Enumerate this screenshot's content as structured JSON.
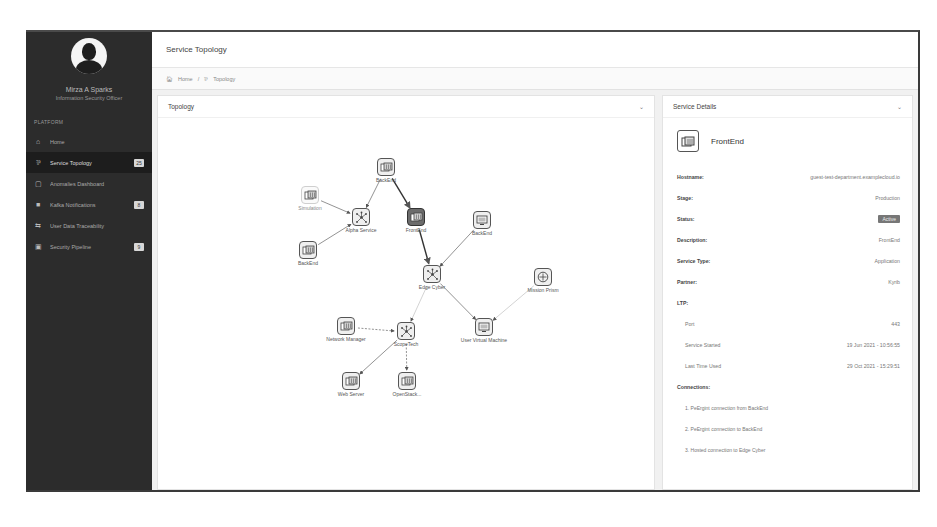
{
  "sidebar": {
    "user_name": "Mirza A Sparks",
    "user_role": "Information Security Officer",
    "section_label": "PLATFORM",
    "items": [
      {
        "label": "Home",
        "icon": "home-icon",
        "badge": null,
        "active": false
      },
      {
        "label": "Service Topology",
        "icon": "topology-icon",
        "badge": "25",
        "active": true
      },
      {
        "label": "Anomalies Dashboard",
        "icon": "dashboard-icon",
        "badge": null,
        "active": false
      },
      {
        "label": "Kafka Notifications",
        "icon": "bell-icon",
        "badge": "8",
        "active": false
      },
      {
        "label": "User Data Traceability",
        "icon": "trace-icon",
        "badge": null,
        "active": false
      },
      {
        "label": "Security Pipeline",
        "icon": "pipeline-icon",
        "badge": "9",
        "active": false
      }
    ]
  },
  "header": {
    "title": "Service Topology"
  },
  "breadcrumb": {
    "home": "Home",
    "separator": "/",
    "current": "Topology"
  },
  "topology_panel": {
    "title": "Topology",
    "nodes": [
      {
        "id": "backend_top",
        "label": "BackEnd",
        "type": "server",
        "x": 228,
        "y": 50,
        "style": "normal"
      },
      {
        "id": "simulation",
        "label": "Simulation",
        "type": "server",
        "x": 152,
        "y": 78,
        "style": "faded"
      },
      {
        "id": "alpha",
        "label": "Alpha Service",
        "type": "hub",
        "x": 203,
        "y": 100,
        "style": "normal"
      },
      {
        "id": "frontend",
        "label": "FrontEnd",
        "type": "server",
        "x": 258,
        "y": 100,
        "style": "dark"
      },
      {
        "id": "backend_left",
        "label": "BackEnd",
        "type": "server",
        "x": 150,
        "y": 133,
        "style": "normal"
      },
      {
        "id": "backend_right",
        "label": "BackEnd",
        "type": "monitor",
        "x": 324,
        "y": 103,
        "style": "normal"
      },
      {
        "id": "edge_cyber",
        "label": "Edge Cyber",
        "type": "hub",
        "x": 274,
        "y": 157,
        "style": "normal"
      },
      {
        "id": "mission_prism",
        "label": "Mission Prism",
        "type": "target",
        "x": 385,
        "y": 160,
        "style": "normal"
      },
      {
        "id": "user_vm",
        "label": "User Virtual Machine",
        "type": "monitor",
        "x": 326,
        "y": 210,
        "style": "normal"
      },
      {
        "id": "network_manager",
        "label": "Network Manager",
        "type": "server",
        "x": 188,
        "y": 209,
        "style": "normal"
      },
      {
        "id": "scope_tech",
        "label": "ScopeTech",
        "type": "hub",
        "x": 248,
        "y": 214,
        "style": "normal"
      },
      {
        "id": "web_server",
        "label": "Web Server",
        "type": "server",
        "x": 193,
        "y": 264,
        "style": "normal"
      },
      {
        "id": "openstack",
        "label": "OpenStack...",
        "type": "server",
        "x": 249,
        "y": 264,
        "style": "normal"
      }
    ],
    "edges": [
      {
        "from": "backend_top",
        "to": "alpha",
        "style": "solid"
      },
      {
        "from": "backend_top",
        "to": "frontend",
        "style": "bold"
      },
      {
        "from": "simulation",
        "to": "alpha",
        "style": "solid"
      },
      {
        "from": "backend_left",
        "to": "alpha",
        "style": "solid"
      },
      {
        "from": "frontend",
        "to": "edge_cyber",
        "style": "bold"
      },
      {
        "from": "backend_right",
        "to": "edge_cyber",
        "style": "solid"
      },
      {
        "from": "edge_cyber",
        "to": "user_vm",
        "style": "solid"
      },
      {
        "from": "mission_prism",
        "to": "user_vm",
        "style": "faint"
      },
      {
        "from": "edge_cyber",
        "to": "scope_tech",
        "style": "faint"
      },
      {
        "from": "network_manager",
        "to": "scope_tech",
        "style": "dashed"
      },
      {
        "from": "scope_tech",
        "to": "web_server",
        "style": "solid"
      },
      {
        "from": "scope_tech",
        "to": "openstack",
        "style": "dashed"
      }
    ]
  },
  "details_panel": {
    "title": "Service Details",
    "service_name": "FrontEnd",
    "fields": {
      "hostname_label": "Hostname:",
      "hostname_value": "guest-test-department.examplecloud.io",
      "stage_label": "Stage:",
      "stage_value": "Production",
      "status_label": "Status:",
      "status_value": "Active",
      "description_label": "Description:",
      "description_value": "FrontEnd",
      "service_type_label": "Service Type:",
      "service_type_value": "Application",
      "partner_label": "Partner:",
      "partner_value": "Kyrib",
      "ltp_label": "LTP:",
      "port_label": "Port",
      "port_value": "443",
      "started_label": "Service Started",
      "started_value": "19 Jun 2021 - 10:56:55",
      "last_label": "Last Time Used",
      "last_value": "29 Oct 2021 - 15:29:51",
      "connections_label": "Connections:"
    },
    "connections": [
      "1. PeErgint connection from BackEnd",
      "2. PeErgint connection to BackEnd",
      "3. Hosted connection to Edge Cyber"
    ]
  }
}
